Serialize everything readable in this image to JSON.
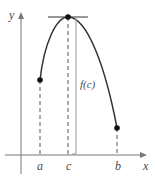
{
  "diagram": {
    "axes": {
      "x_label": "x",
      "y_label": "y"
    },
    "points": [
      {
        "name": "a",
        "label": "a",
        "x": 40,
        "y": 80
      },
      {
        "name": "c",
        "label": "c",
        "x": 68,
        "y": 17
      },
      {
        "name": "b",
        "label": "b",
        "x": 117,
        "y": 128
      }
    ],
    "annotation": {
      "label": "f(c)"
    },
    "colors": {
      "curve": "#333333",
      "axis": "#777777",
      "dashed": "#555555",
      "fc_line": "#999999"
    }
  }
}
